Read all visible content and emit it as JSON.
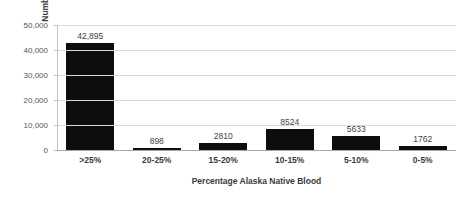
{
  "chart_data": {
    "type": "bar",
    "title": "",
    "subtitle": "",
    "xlabel": "Percentage Alaska Native Blood",
    "ylabel": "Number of Individuals Issued a CDIB",
    "categories": [
      ">25%",
      "20-25%",
      "15-20%",
      "10-15%",
      "5-10%",
      "0-5%"
    ],
    "values": [
      42895,
      898,
      2810,
      8524,
      5633,
      1762
    ],
    "data_labels": [
      "42,895",
      "898",
      "2810",
      "8524",
      "5633",
      "1762"
    ],
    "ylim": [
      0,
      50000
    ],
    "y_ticks": [
      0,
      10000,
      20000,
      30000,
      40000,
      50000
    ],
    "y_tick_labels": [
      "0",
      "10,000",
      "20,000",
      "30,000",
      "40,000",
      "50,000"
    ],
    "grid": "horizontal",
    "legend": "none",
    "bar_color": "#0d0d0d",
    "gridline_color": "#d9d9d9",
    "axis_color": "#a6a6a6",
    "background_color": "#ffffff"
  }
}
